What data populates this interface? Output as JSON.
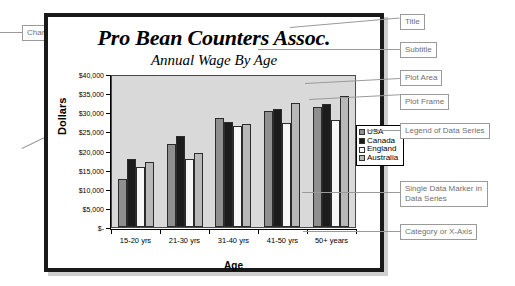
{
  "chart_data": {
    "type": "bar",
    "title": "Pro Bean Counters Assoc.",
    "subtitle": "Annual Wage By Age",
    "xlabel": "Age",
    "ylabel": "Dollars",
    "grid": false,
    "legend_position": "right-inside",
    "ylim": [
      0,
      40000
    ],
    "ytick_labels": [
      "$40,000",
      "$35,000",
      "$30,000",
      "$25,000",
      "$20,000",
      "$15,000",
      "$10,000",
      "$5,000",
      "$-"
    ],
    "ytick_values": [
      40000,
      35000,
      30000,
      25000,
      20000,
      15000,
      10000,
      5000,
      0
    ],
    "categories": [
      "15-20 yrs",
      "21-30 yrs",
      "31-40 yrs",
      "41-50 yrs",
      "50+ years"
    ],
    "series": [
      {
        "name": "USA",
        "color": "#8f8f8f",
        "values": [
          12700,
          22000,
          28800,
          30700,
          31700
        ]
      },
      {
        "name": "Canada",
        "color": "#1c1c1c",
        "values": [
          18000,
          24000,
          27700,
          31300,
          32600
        ]
      },
      {
        "name": "England",
        "color": "#f7f7f7",
        "values": [
          16000,
          18000,
          26700,
          27600,
          28300
        ]
      },
      {
        "name": "Australia",
        "color": "#b8b8b8",
        "values": [
          17200,
          19500,
          27200,
          32900,
          34800
        ]
      }
    ],
    "plot_area_color": "#d9d9d9",
    "chart_area_color": "#ffffff"
  },
  "annotations": [
    {
      "id": "chart-area",
      "label": "Chart area"
    },
    {
      "id": "title",
      "label": "Title"
    },
    {
      "id": "subtitle",
      "label": "Subtitle"
    },
    {
      "id": "plot-area",
      "label": "Plot Area"
    },
    {
      "id": "plot-frame",
      "label": "Plot Frame"
    },
    {
      "id": "legend",
      "label": "Legend of Data Series"
    },
    {
      "id": "y-axis-title",
      "label": "Y-Axis Title"
    },
    {
      "id": "data-marker",
      "label": "Single Data Marker in Data Series"
    },
    {
      "id": "x-axis-cat",
      "label": "Category or X-Axis"
    },
    {
      "id": "y-axis-value",
      "label": "Value of Y-Axis"
    },
    {
      "id": "x-axis-title",
      "label": "X-Axis Title"
    }
  ]
}
